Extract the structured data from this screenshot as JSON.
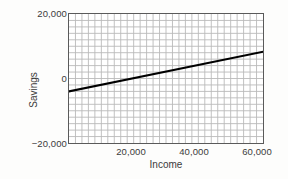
{
  "chart_data": {
    "type": "line",
    "title": "",
    "xlabel": "Income",
    "ylabel": "Savings",
    "xlim": [
      0,
      62000
    ],
    "ylim": [
      -20000,
      20000
    ],
    "grid": true,
    "grid_minor_x_count": 30,
    "grid_minor_y_count": 20,
    "legend": "none",
    "x_ticks": [
      20000,
      40000,
      60000
    ],
    "x_tick_labels": [
      "20,000",
      "40,000",
      "60,000"
    ],
    "y_ticks": [
      20000,
      0,
      -20000
    ],
    "y_tick_labels": [
      "20,000",
      "0",
      "−20,000"
    ],
    "series": [
      {
        "name": "regression-line",
        "color": "#000000",
        "line_width": 2.2,
        "x": [
          0,
          62000
        ],
        "values": [
          -4000,
          8300
        ]
      }
    ],
    "colors": {
      "line": "#000000",
      "grid": "#b9b9b9",
      "axis_border": "#5a5a5a",
      "text": "#3b3b3b",
      "plot_background": "#ffffff",
      "figure_background": "#fdfdfc"
    }
  },
  "axis_titles": {
    "y": "Savings",
    "x": "Income"
  },
  "y_tick_labels": {
    "top": "20,000",
    "middle": "0",
    "bottom": "−20,000"
  },
  "x_tick_labels": {
    "t20k": "20,000",
    "t40k": "40,000",
    "t60k": "60,000"
  }
}
